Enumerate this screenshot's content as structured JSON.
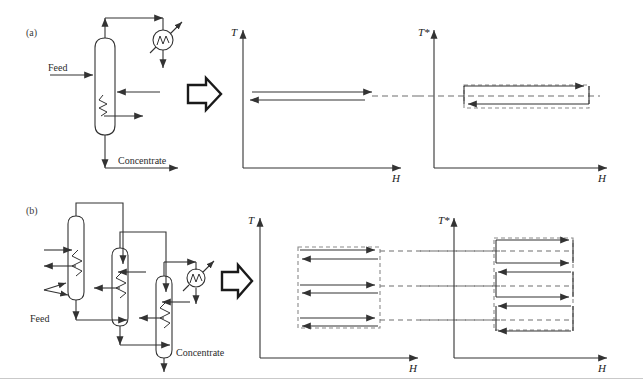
{
  "figure": {
    "background_color": "#ffffff",
    "line_color": "#333333",
    "dashed_color": "#6e6e6e",
    "panels": [
      {
        "id": "a",
        "label": "(a)",
        "description": "Single-effect evaporator flowsheet mapped to T-H and T*-H diagrams",
        "flowsheet": {
          "stream_labels": [
            {
              "name": "feed-label",
              "text": "Feed"
            },
            {
              "name": "concentrate-label",
              "text": "Concentrate"
            }
          ],
          "units": [
            {
              "name": "evaporator-column",
              "type": "column"
            },
            {
              "name": "condenser",
              "type": "condenser-circle"
            },
            {
              "name": "heating-coil",
              "type": "coil"
            }
          ]
        },
        "charts": [
          {
            "name": "th-diagram",
            "ylabel": "T",
            "xlabel": "H",
            "arrows": [
              {
                "direction": "right",
                "level": 1
              },
              {
                "direction": "left",
                "level": 2
              }
            ],
            "dashed_extensions": 1
          },
          {
            "name": "tstar-diagram",
            "ylabel": "T*",
            "xlabel": "H",
            "arrows": [
              {
                "direction": "right",
                "level": 1
              },
              {
                "direction": "left",
                "level": 2
              }
            ],
            "dashed_box": true
          }
        ]
      },
      {
        "id": "b",
        "label": "(b)",
        "description": "Triple-effect evaporator flowsheet mapped to T-H and T*-H diagrams",
        "flowsheet": {
          "stream_labels": [
            {
              "name": "feed-label",
              "text": "Feed"
            },
            {
              "name": "concentrate-label",
              "text": "Concentrate"
            }
          ],
          "units": [
            {
              "name": "evaporator-column-1",
              "type": "column"
            },
            {
              "name": "evaporator-column-2",
              "type": "column"
            },
            {
              "name": "evaporator-column-3",
              "type": "column"
            },
            {
              "name": "condenser",
              "type": "condenser-circle"
            },
            {
              "name": "heating-coil-1",
              "type": "coil"
            },
            {
              "name": "heating-coil-2",
              "type": "coil"
            },
            {
              "name": "heating-coil-3",
              "type": "coil"
            }
          ]
        },
        "charts": [
          {
            "name": "th-diagram",
            "ylabel": "T",
            "xlabel": "H",
            "arrow_pairs": 3,
            "dashed_box": true,
            "dashed_extensions": 3
          },
          {
            "name": "tstar-diagram",
            "ylabel": "T*",
            "xlabel": "H",
            "arrow_count": 6,
            "dashed_box": true,
            "dashed_extensions": 3
          }
        ]
      }
    ],
    "connector_glyphs": [
      {
        "name": "block-arrow-a",
        "shape": "right-block-arrow"
      },
      {
        "name": "block-arrow-b",
        "shape": "right-block-arrow"
      }
    ]
  }
}
